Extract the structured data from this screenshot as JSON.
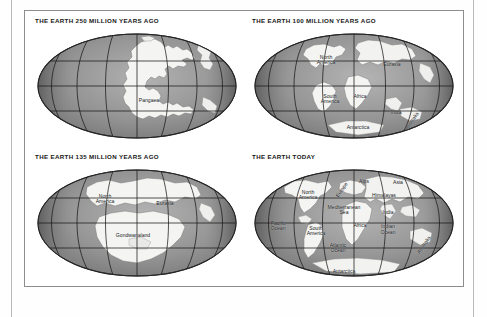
{
  "figure": {
    "panels": [
      {
        "id": "earth-250-mya",
        "title": "THE EARTH 250 MILLION YEARS AGO",
        "labels": [
          {
            "name": "pangaea",
            "text": "Pangaea",
            "x": 56,
            "y": 64
          }
        ]
      },
      {
        "id": "earth-100-mya",
        "title": "THE EARTH 100 MILLION YEARS AGO",
        "labels": [
          {
            "name": "north-america",
            "text": "North\nAmerica",
            "x": 36,
            "y": 25
          },
          {
            "name": "eurasia",
            "text": "Eurasia",
            "x": 69,
            "y": 30
          },
          {
            "name": "south-america",
            "text": "South\nAmerica",
            "x": 38,
            "y": 62
          },
          {
            "name": "africa",
            "text": "Africa",
            "x": 53,
            "y": 60
          },
          {
            "name": "india",
            "text": "India",
            "x": 71,
            "y": 75
          },
          {
            "name": "antarctica",
            "text": "Antarctica",
            "x": 52,
            "y": 88
          },
          {
            "name": "australia",
            "text": "Australia",
            "x": 77,
            "y": 83
          }
        ]
      },
      {
        "id": "earth-135-mya",
        "title": "THE EARTH 135 MILLION YEARS AGO",
        "labels": [
          {
            "name": "north-america",
            "text": "North\nAmerica",
            "x": 34,
            "y": 28
          },
          {
            "name": "eurasia",
            "text": "Eurasia",
            "x": 64,
            "y": 32
          },
          {
            "name": "gondwanaland",
            "text": "Gondwanaland",
            "x": 48,
            "y": 62
          }
        ]
      },
      {
        "id": "earth-today",
        "title": "THE EARTH TODAY",
        "labels": [
          {
            "name": "north-america",
            "text": "North\nAmerica",
            "x": 27,
            "y": 24
          },
          {
            "name": "europe",
            "text": "Europe",
            "x": 44,
            "y": 18
          },
          {
            "name": "alps",
            "text": "Alps",
            "x": 54,
            "y": 13
          },
          {
            "name": "asia",
            "text": "Asia",
            "x": 71,
            "y": 14
          },
          {
            "name": "himalayas",
            "text": "Himalayas",
            "x": 65,
            "y": 25
          },
          {
            "name": "mediterranean-sea",
            "text": "Mediterranean\nSea",
            "x": 45,
            "y": 38
          },
          {
            "name": "pacific-ocean",
            "text": "Pacific\nOcean",
            "x": 12,
            "y": 53
          },
          {
            "name": "south-america",
            "text": "South\nAmerica",
            "x": 31,
            "y": 57
          },
          {
            "name": "africa",
            "text": "Africa",
            "x": 53,
            "y": 53
          },
          {
            "name": "india",
            "text": "India",
            "x": 67,
            "y": 41
          },
          {
            "name": "indian-ocean",
            "text": "Indian\nOcean",
            "x": 67,
            "y": 55
          },
          {
            "name": "atlantic-ocean",
            "text": "Atlantic\nOcean",
            "x": 42,
            "y": 73
          },
          {
            "name": "australia",
            "text": "Australia",
            "x": 85,
            "y": 70
          },
          {
            "name": "antarctica",
            "text": "Antarctica",
            "x": 45,
            "y": 94
          }
        ]
      }
    ]
  },
  "colors": {
    "ocean_dark": "#6f6f6f",
    "ocean_mid": "#8e8e8e",
    "ocean_light": "#a5a5a5",
    "land": "#f4f4f2",
    "land_shadow": "#bdbdbd",
    "grid": "#1a1a1a",
    "frame": "#8d8d8d",
    "page_rule": "#b9b9b9",
    "title_text": "#171717",
    "label_text": "#15171a",
    "background": "#ffffff"
  }
}
